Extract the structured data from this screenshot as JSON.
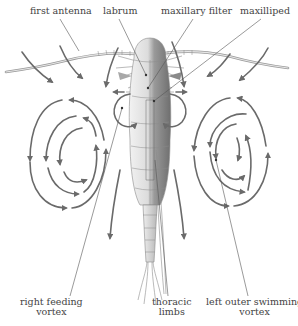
{
  "figure": {
    "labels": {
      "first_antenna": "first antenna",
      "labrum": "labrum",
      "maxillary_filter": "maxillary filter",
      "maxilliped": "maxilliped",
      "right_feeding_vortex": [
        "right feeding",
        "vortex"
      ],
      "thoracic_limbs": [
        "thoracic",
        "limbs"
      ],
      "left_outer_swimming_vortex": [
        "left outer swimming",
        "vortex"
      ]
    },
    "colors": {
      "flow_arrows": "#6a6a6a",
      "body_light": "#e8e8e8",
      "body_dark": "#7a7a7a",
      "text": "#444444",
      "leader_lines": "#555555"
    }
  }
}
